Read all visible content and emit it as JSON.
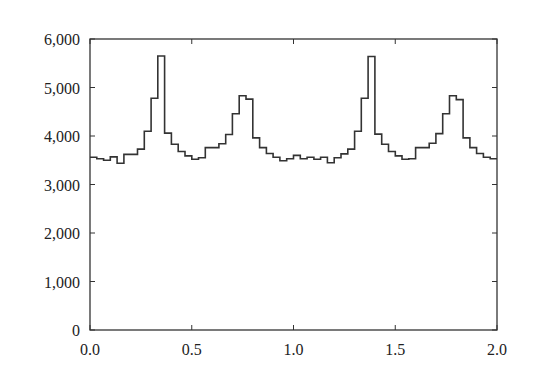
{
  "chart_data": {
    "type": "bar",
    "style": "step-histogram",
    "title": "",
    "xlabel": "",
    "ylabel": "",
    "xlim": [
      0.0,
      2.0
    ],
    "ylim": [
      0,
      6000
    ],
    "grid": false,
    "legend": null,
    "x_ticks": [
      "0.0",
      "0.5",
      "1.0",
      "1.5",
      "2.0"
    ],
    "y_ticks": [
      "0",
      "1,000",
      "2,000",
      "3,000",
      "4,000",
      "5,000",
      "6,000"
    ],
    "bin_width": 0.0333,
    "values": [
      3560,
      3530,
      3500,
      3570,
      3440,
      3620,
      3620,
      3730,
      4100,
      4780,
      5650,
      4060,
      3830,
      3680,
      3590,
      3520,
      3550,
      3760,
      3760,
      3840,
      4030,
      4460,
      4830,
      4760,
      3960,
      3760,
      3640,
      3560,
      3490,
      3530,
      3600,
      3530,
      3560,
      3520,
      3560,
      3450,
      3550,
      3630,
      3730,
      4100,
      4780,
      5640,
      4040,
      3830,
      3680,
      3590,
      3520,
      3530,
      3760,
      3760,
      3850,
      4050,
      4460,
      4830,
      4750,
      3960,
      3760,
      3640,
      3560,
      3530
    ]
  }
}
